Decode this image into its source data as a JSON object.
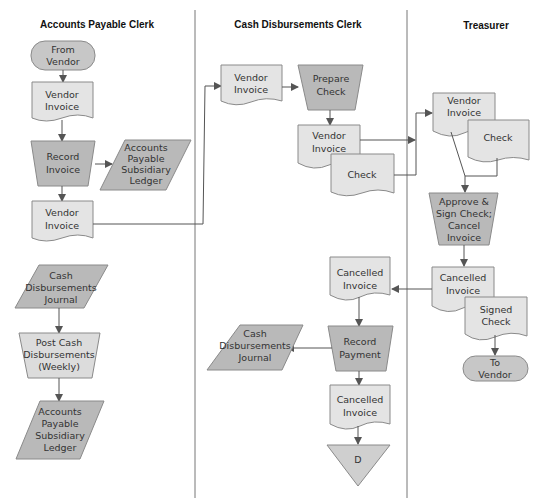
{
  "lanes": [
    {
      "title": "Accounts Payable Clerk"
    },
    {
      "title": "Cash Disbursements Clerk"
    },
    {
      "title": "Treasurer"
    }
  ],
  "nodes": {
    "ap_from_vendor": {
      "type": "terminal",
      "line1": "From",
      "line2": "Vendor"
    },
    "ap_vendor_invoice_1": {
      "type": "document",
      "line1": "Vendor",
      "line2": "Invoice"
    },
    "ap_record_invoice": {
      "type": "manual-process",
      "line1": "Record",
      "line2": "Invoice"
    },
    "ap_subsidiary_ledger_1": {
      "type": "ledger",
      "line1": "Accounts",
      "line2": "Payable",
      "line3": "Subsidiary",
      "line4": "Ledger"
    },
    "ap_vendor_invoice_2": {
      "type": "document",
      "line1": "Vendor",
      "line2": "Invoice"
    },
    "ap_cash_journal": {
      "type": "ledger",
      "line1": "Cash",
      "line2": "Disbursements",
      "line3": "Journal"
    },
    "ap_post_cash": {
      "type": "manual-process",
      "line1": "Post Cash",
      "line2": "Disbursements",
      "line3": "(Weekly)"
    },
    "ap_subsidiary_ledger_2": {
      "type": "ledger",
      "line1": "Accounts",
      "line2": "Payable",
      "line3": "Subsidiary",
      "line4": "Ledger"
    },
    "cd_vendor_invoice_1": {
      "type": "document",
      "line1": "Vendor",
      "line2": "Invoice"
    },
    "cd_prepare_check": {
      "type": "manual-process",
      "line1": "Prepare",
      "line2": "Check"
    },
    "cd_vendor_invoice_2": {
      "type": "document",
      "line1": "Vendor",
      "line2": "Invoice"
    },
    "cd_check": {
      "type": "document",
      "line1": "Check"
    },
    "cd_cancelled_invoice_1": {
      "type": "document",
      "line1": "Cancelled",
      "line2": "Invoice"
    },
    "cd_record_payment": {
      "type": "manual-process",
      "line1": "Record",
      "line2": "Payment"
    },
    "cd_cash_journal": {
      "type": "ledger",
      "line1": "Cash",
      "line2": "Disbursements",
      "line3": "Journal"
    },
    "cd_cancelled_invoice_2": {
      "type": "document",
      "line1": "Cancelled",
      "line2": "Invoice"
    },
    "cd_file_d": {
      "type": "offline-file",
      "line1": "D"
    },
    "tr_vendor_invoice": {
      "type": "document",
      "line1": "Vendor",
      "line2": "Invoice"
    },
    "tr_check": {
      "type": "document",
      "line1": "Check"
    },
    "tr_approve_sign": {
      "type": "manual-process",
      "line1": "Approve &",
      "line2": "Sign Check;",
      "line3": "Cancel",
      "line4": "Invoice"
    },
    "tr_cancelled_invoice": {
      "type": "document",
      "line1": "Cancelled",
      "line2": "Invoice"
    },
    "tr_signed_check": {
      "type": "document",
      "line1": "Signed",
      "line2": "Check"
    },
    "tr_to_vendor": {
      "type": "terminal",
      "line1": "To",
      "line2": "Vendor"
    }
  },
  "colors": {
    "document_fill": "#e4e4e4",
    "process_fill": "#b9b9b9",
    "terminal_fill": "#c7c7c7",
    "stroke": "#8a8a8a",
    "edge": "#555555"
  }
}
